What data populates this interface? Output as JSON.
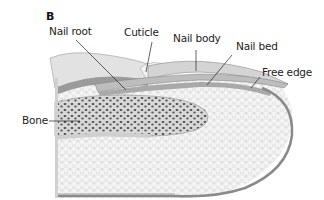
{
  "figure": {
    "panel_label": "B",
    "labels": {
      "nail_root": "Nail root",
      "cuticle": "Cuticle",
      "nail_body": "Nail body",
      "nail_bed": "Nail bed",
      "free_edge": "Free edge",
      "bone": "Bone"
    },
    "colors": {
      "skin_outline": "#8a8a8a",
      "tissue_fill": "#e6e6e6",
      "nail_fill": "#cfcfcf",
      "bone_spots": "#555555",
      "leader_line": "#222222"
    }
  }
}
